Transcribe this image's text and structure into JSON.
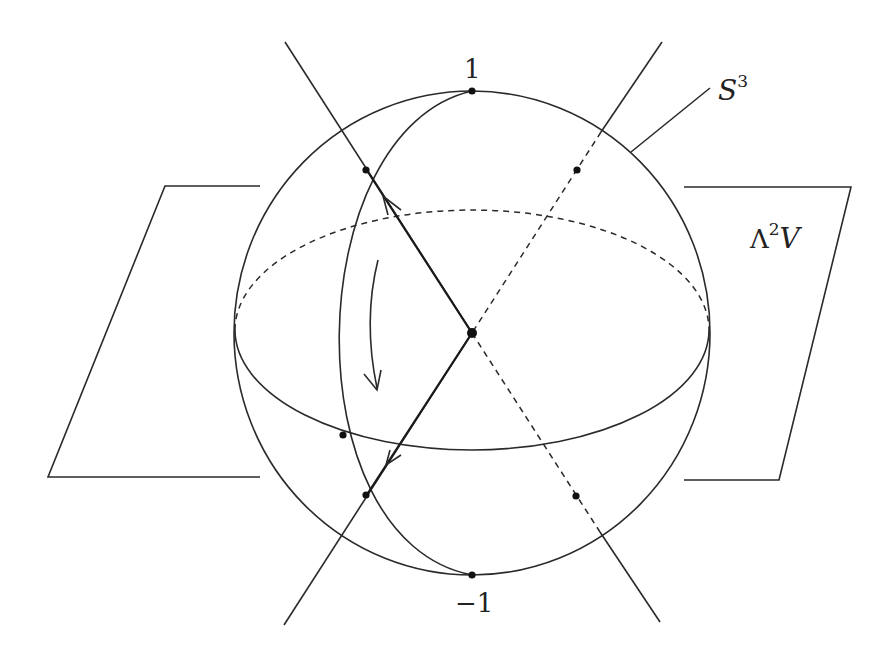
{
  "figure": {
    "labels": {
      "top_point": "1",
      "bottom_point": "−1",
      "sphere_base": "S",
      "sphere_exp": "3",
      "plane_wedge": "Λ",
      "plane_exp": "2",
      "plane_base": "V"
    },
    "elements": [
      "sphere S^3 (outline)",
      "equatorial ellipse (front solid, back dashed)",
      "great circle through 1 and −1",
      "plane Λ^2V (left and right visible parts)",
      "two lines through the center intersecting the sphere",
      "vectors from center with arrowheads",
      "curved rotation arrow"
    ],
    "colors": {
      "ink": "#2a2a2a",
      "background": "#ffffff"
    }
  }
}
